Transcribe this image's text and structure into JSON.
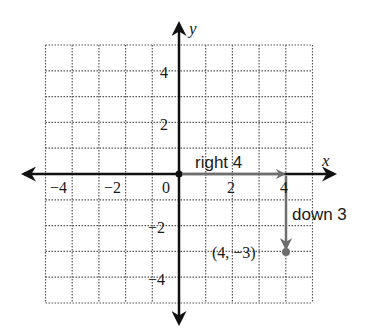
{
  "diagram": {
    "type": "coordinate-plane-translation",
    "axes": {
      "x_label": "x",
      "y_label": "y",
      "origin_label": "0",
      "x_ticks": [
        {
          "value": -4,
          "label": "−4"
        },
        {
          "value": -2,
          "label": "−2"
        },
        {
          "value": 2,
          "label": "2"
        },
        {
          "value": 4,
          "label": "4"
        }
      ],
      "y_ticks": [
        {
          "value": 4,
          "label": "4"
        },
        {
          "value": 2,
          "label": "2"
        },
        {
          "value": -2,
          "label": "−2"
        },
        {
          "value": -4,
          "label": "−4"
        }
      ],
      "x_range": [
        -5,
        5
      ],
      "y_range": [
        -5,
        5
      ],
      "grid": "dotted"
    },
    "moves": [
      {
        "label": "right 4",
        "from": [
          0,
          0
        ],
        "to": [
          4,
          0
        ]
      },
      {
        "label": "down 3",
        "from": [
          4,
          0
        ],
        "to": [
          4,
          -3
        ]
      }
    ],
    "point": {
      "x": 4,
      "y": -3,
      "label": "(4, −3)"
    },
    "colors": {
      "axis": "#111111",
      "grid": "#555555",
      "move_arrow": "#6e6e6e",
      "point": "#6e6e6e",
      "text": "#1a1a1a"
    }
  }
}
